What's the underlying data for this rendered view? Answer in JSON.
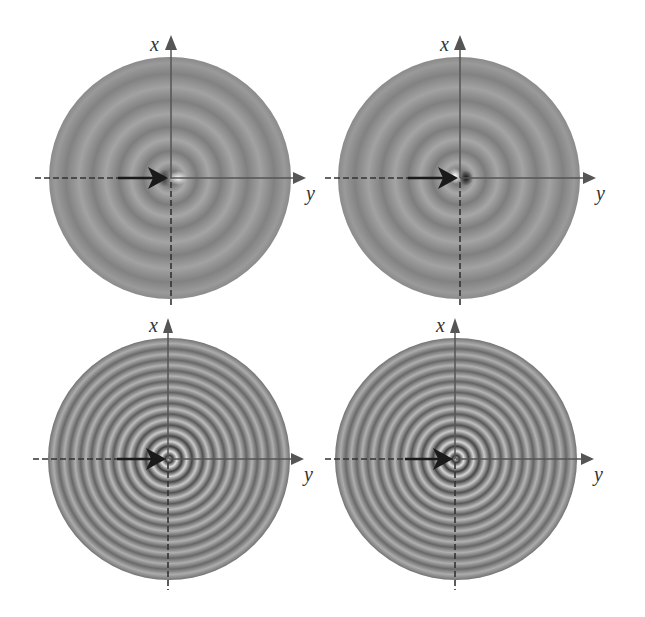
{
  "figure": {
    "background": "#ffffff",
    "disk_base_color": "#8c8c8c",
    "axis_color": "#555555",
    "dash_color": "#333333",
    "arrow_color": "#1a1a1a",
    "panels": [
      {
        "id": "top-left",
        "x_axis_label": "x",
        "y_axis_label": "y",
        "center": [
          170,
          178
        ],
        "radius": 121,
        "ring_count": 5,
        "ring_contrast": "low",
        "center_feature": "bright spot right of origin"
      },
      {
        "id": "top-right",
        "x_axis_label": "x",
        "y_axis_label": "y",
        "center": [
          459,
          178
        ],
        "radius": 121,
        "ring_count": 5,
        "ring_contrast": "low",
        "center_feature": "dark spot right of origin"
      },
      {
        "id": "bottom-left",
        "x_axis_label": "x",
        "y_axis_label": "y",
        "center": [
          169,
          459
        ],
        "radius": 121,
        "ring_count": 11,
        "ring_contrast": "high",
        "center_feature": "concentric bright/dark rings"
      },
      {
        "id": "bottom-right",
        "x_axis_label": "x",
        "y_axis_label": "y",
        "center": [
          456,
          459
        ],
        "radius": 121,
        "ring_count": 11,
        "ring_contrast": "high",
        "center_feature": "concentric bright/dark rings"
      }
    ]
  }
}
